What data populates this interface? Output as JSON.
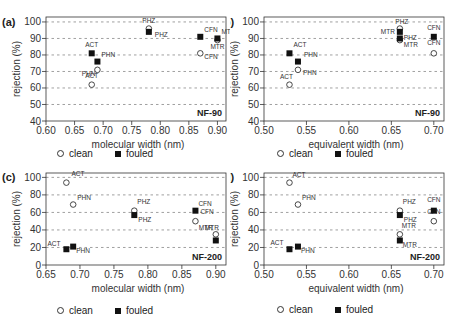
{
  "legend": {
    "clean_label": "clean",
    "fouled_label": "fouled"
  },
  "chart_data": [
    {
      "id": "a",
      "panel_label": "(a)",
      "type": "scatter",
      "membrane": "NF-90",
      "xlabel": "molecular width (nm)",
      "ylabel": "rejection (%)",
      "xlim": [
        0.6,
        0.915
      ],
      "ylim": [
        40,
        103
      ],
      "xticks": [
        0.6,
        0.65,
        0.7,
        0.75,
        0.8,
        0.85,
        0.9
      ],
      "xtick_labels": [
        "0.60",
        "0.65",
        "0.70",
        "0.75",
        "0.80",
        "0.85",
        "0.90"
      ],
      "yticks": [
        40,
        50,
        60,
        70,
        80,
        90,
        100
      ],
      "ytick_labels": [
        "40",
        "50",
        "60",
        "70",
        "80",
        "90",
        "100"
      ],
      "grid": "horizontal dashed",
      "series": [
        {
          "name": "clean",
          "marker": "open-circle",
          "points": [
            {
              "label": "ACT",
              "x": 0.68,
              "y": 62
            },
            {
              "label": "PHN",
              "x": 0.69,
              "y": 71
            },
            {
              "label": "PHZ",
              "x": 0.78,
              "y": 96
            },
            {
              "label": "CFN",
              "x": 0.87,
              "y": 81
            },
            {
              "label": "MTR",
              "x": 0.9,
              "y": 89
            }
          ]
        },
        {
          "name": "fouled",
          "marker": "filled-square",
          "points": [
            {
              "label": "ACT",
              "x": 0.68,
              "y": 81
            },
            {
              "label": "PHN",
              "x": 0.69,
              "y": 76
            },
            {
              "label": "PHZ",
              "x": 0.78,
              "y": 94
            },
            {
              "label": "CFN",
              "x": 0.87,
              "y": 91
            },
            {
              "label": "MTR",
              "x": 0.9,
              "y": 90
            }
          ]
        }
      ]
    },
    {
      "id": "b",
      "panel_label": "(b)",
      "type": "scatter",
      "membrane": "NF-90",
      "xlabel": "equivalent width (nm)",
      "ylabel": "rejection (%)",
      "xlim": [
        0.5,
        0.712
      ],
      "ylim": [
        40,
        103
      ],
      "xticks": [
        0.5,
        0.55,
        0.6,
        0.65,
        0.7
      ],
      "xtick_labels": [
        "0.50",
        "0.55",
        "0.60",
        "0.65",
        "0.70"
      ],
      "yticks": [
        40,
        50,
        60,
        70,
        80,
        90,
        100
      ],
      "ytick_labels": [
        "40",
        "50",
        "60",
        "70",
        "80",
        "90",
        "100"
      ],
      "grid": "horizontal dashed",
      "series": [
        {
          "name": "clean",
          "marker": "open-circle",
          "points": [
            {
              "label": "ACT",
              "x": 0.53,
              "y": 62
            },
            {
              "label": "PHN",
              "x": 0.54,
              "y": 71
            },
            {
              "label": "PHZ",
              "x": 0.66,
              "y": 96
            },
            {
              "label": "MTR",
              "x": 0.66,
              "y": 89
            },
            {
              "label": "CFN",
              "x": 0.7,
              "y": 81
            }
          ]
        },
        {
          "name": "fouled",
          "marker": "filled-square",
          "points": [
            {
              "label": "ACT",
              "x": 0.53,
              "y": 81
            },
            {
              "label": "PHN",
              "x": 0.54,
              "y": 76
            },
            {
              "label": "MTR",
              "x": 0.66,
              "y": 94
            },
            {
              "label": "PHZ",
              "x": 0.66,
              "y": 90
            },
            {
              "label": "CFN",
              "x": 0.7,
              "y": 91
            }
          ]
        }
      ]
    },
    {
      "id": "c",
      "panel_label": "(c)",
      "type": "scatter",
      "membrane": "NF-200",
      "xlabel": "molecular width (nm)",
      "ylabel": "rejection (%)",
      "xlim": [
        0.65,
        0.915
      ],
      "ylim": [
        0,
        105
      ],
      "xticks": [
        0.65,
        0.7,
        0.75,
        0.8,
        0.85,
        0.9
      ],
      "xtick_labels": [
        "0.65",
        "0.70",
        "0.75",
        "0.80",
        "0.85",
        "0.90"
      ],
      "yticks": [
        0,
        20,
        40,
        60,
        80,
        100
      ],
      "ytick_labels": [
        "0",
        "20",
        "40",
        "60",
        "80",
        "100"
      ],
      "grid": "horizontal dashed",
      "series": [
        {
          "name": "clean",
          "marker": "open-circle",
          "points": [
            {
              "label": "ACT",
              "x": 0.68,
              "y": 94
            },
            {
              "label": "PHN",
              "x": 0.69,
              "y": 69
            },
            {
              "label": "PHZ",
              "x": 0.78,
              "y": 62
            },
            {
              "label": "CFN",
              "x": 0.87,
              "y": 50
            },
            {
              "label": "MTR",
              "x": 0.9,
              "y": 35
            }
          ]
        },
        {
          "name": "fouled",
          "marker": "filled-square",
          "points": [
            {
              "label": "ACT",
              "x": 0.68,
              "y": 18
            },
            {
              "label": "PHN",
              "x": 0.69,
              "y": 21
            },
            {
              "label": "PHZ",
              "x": 0.78,
              "y": 57
            },
            {
              "label": "CFN",
              "x": 0.87,
              "y": 62
            },
            {
              "label": "MTR",
              "x": 0.9,
              "y": 28
            }
          ]
        }
      ]
    },
    {
      "id": "d",
      "panel_label": "(d)",
      "type": "scatter",
      "membrane": "NF-200",
      "xlabel": "equivalent width (nm)",
      "ylabel": "rejection (%)",
      "xlim": [
        0.5,
        0.712
      ],
      "ylim": [
        0,
        105
      ],
      "xticks": [
        0.5,
        0.55,
        0.6,
        0.65,
        0.7
      ],
      "xtick_labels": [
        "0.50",
        "0.55",
        "0.60",
        "0.65",
        "0.70"
      ],
      "yticks": [
        0,
        20,
        40,
        60,
        80,
        100
      ],
      "ytick_labels": [
        "0",
        "20",
        "40",
        "60",
        "80",
        "100"
      ],
      "grid": "horizontal dashed",
      "series": [
        {
          "name": "clean",
          "marker": "open-circle",
          "points": [
            {
              "label": "ACT",
              "x": 0.53,
              "y": 94
            },
            {
              "label": "PHN",
              "x": 0.54,
              "y": 69
            },
            {
              "label": "PHZ",
              "x": 0.66,
              "y": 62
            },
            {
              "label": "MTR",
              "x": 0.66,
              "y": 35
            },
            {
              "label": "CFN",
              "x": 0.7,
              "y": 50
            }
          ]
        },
        {
          "name": "fouled",
          "marker": "filled-square",
          "points": [
            {
              "label": "ACT",
              "x": 0.53,
              "y": 18
            },
            {
              "label": "PHN",
              "x": 0.54,
              "y": 21
            },
            {
              "label": "PHZ",
              "x": 0.66,
              "y": 57
            },
            {
              "label": "MTR",
              "x": 0.66,
              "y": 28
            },
            {
              "label": "CFN",
              "x": 0.7,
              "y": 62
            }
          ]
        }
      ]
    }
  ]
}
